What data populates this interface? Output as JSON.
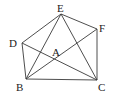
{
  "diagram": {
    "type": "geometry",
    "points": {
      "A": {
        "label": "A",
        "x": 56,
        "y": 59,
        "lx": 52,
        "ly": 55
      },
      "B": {
        "label": "B",
        "x": 26,
        "y": 79,
        "lx": 16,
        "ly": 91
      },
      "C": {
        "label": "C",
        "x": 97,
        "y": 80,
        "lx": 98,
        "ly": 91
      },
      "D": {
        "label": "D",
        "x": 22,
        "y": 43,
        "lx": 9,
        "ly": 47
      },
      "E": {
        "label": "E",
        "x": 61,
        "y": 14,
        "lx": 57,
        "ly": 12
      },
      "F": {
        "label": "F",
        "x": 97,
        "y": 29,
        "lx": 99,
        "ly": 32
      }
    },
    "segments": [
      [
        "D",
        "E"
      ],
      [
        "E",
        "F"
      ],
      [
        "F",
        "C"
      ],
      [
        "B",
        "C"
      ],
      [
        "D",
        "B"
      ],
      [
        "E",
        "B"
      ],
      [
        "E",
        "C"
      ],
      [
        "B",
        "F"
      ],
      [
        "D",
        "C"
      ]
    ],
    "colors": {
      "stroke": "#3a3a3a",
      "label": "#222222"
    }
  }
}
